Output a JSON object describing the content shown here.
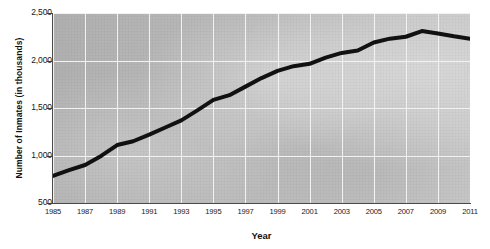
{
  "chart_data": {
    "type": "line",
    "title": "",
    "xlabel": "Year",
    "ylabel": "Number of Inmates (in thousands)",
    "xlim": [
      1985,
      2011
    ],
    "ylim": [
      500,
      2500
    ],
    "ytick_labels": [
      "2,500",
      "2,000",
      "1,500",
      "1,000",
      "500"
    ],
    "ytick_values": [
      2500,
      2000,
      1500,
      1000,
      500
    ],
    "xtick_labels": [
      "1985",
      "1987",
      "1989",
      "1991",
      "1993",
      "1995",
      "1997",
      "1999",
      "2001",
      "2003",
      "2005",
      "2007",
      "2009",
      "2011"
    ],
    "xtick_values": [
      1985,
      1987,
      1989,
      1991,
      1993,
      1995,
      1997,
      1999,
      2001,
      2003,
      2005,
      2007,
      2009,
      2011
    ],
    "grid": true,
    "grid_color": "#f2f2f2",
    "plot_background": "#b9b9b9",
    "line_color": "#111111",
    "line_width": 4,
    "legend": false,
    "series": [
      {
        "name": "Number of Inmates",
        "x": [
          1985,
          1986,
          1987,
          1988,
          1989,
          1990,
          1991,
          1992,
          1993,
          1994,
          1995,
          1996,
          1997,
          1998,
          1999,
          2000,
          2001,
          2002,
          2003,
          2004,
          2005,
          2006,
          2007,
          2008,
          2009,
          2010,
          2011
        ],
        "values": [
          785,
          845,
          900,
          995,
          1110,
          1150,
          1220,
          1295,
          1370,
          1475,
          1585,
          1635,
          1725,
          1815,
          1890,
          1940,
          1965,
          2030,
          2080,
          2105,
          2190,
          2230,
          2250,
          2310,
          2285,
          2255,
          2230
        ]
      }
    ]
  },
  "axis": {
    "y_title": "Number of Inmates (in thousands)",
    "x_title": "Year"
  }
}
